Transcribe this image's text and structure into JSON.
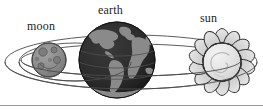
{
  "diagram": {
    "background_color": "#ffffff",
    "border_color": "#9a9a9a",
    "labels": {
      "moon": "moon",
      "earth": "earth",
      "sun": "sun"
    },
    "bodies": [
      {
        "name": "moon",
        "label": "moon",
        "cx": 49,
        "cy": 60,
        "r": 17,
        "fill_color": "#8e8e8e",
        "stroke_color": "#3c3c3c",
        "detail": "cratered gray disc"
      },
      {
        "name": "earth",
        "label": "earth",
        "cx": 117,
        "cy": 60,
        "r": 38,
        "fill_color": "#2b2b2b",
        "land_color": "#8a8a8a",
        "stroke_color": "#1a1a1a",
        "detail": "dark globe with gray continents"
      },
      {
        "name": "sun",
        "label": "sun",
        "cx": 222,
        "cy": 62,
        "r": 19,
        "ray_count": 14,
        "ray_outer_r": 34,
        "fill_color": "#e2e2e2",
        "ray_fill_color": "#d8d8d8",
        "stroke_color": "#2a2a2a",
        "detail": "flame-petal rays around light disc with spiral highlight"
      }
    ],
    "orbits": [
      {
        "name": "earth-orbit-outer",
        "cx": 131,
        "cy": 62,
        "rx": 126,
        "ry": 27,
        "stroke_color": "#4a4a4a"
      },
      {
        "name": "earth-orbit-inner",
        "cx": 131,
        "cy": 60,
        "rx": 110,
        "ry": 16,
        "stroke_color": "#4a4a4a"
      },
      {
        "name": "moon-orbit",
        "cx": 75,
        "cy": 62,
        "rx": 56,
        "ry": 19,
        "stroke_color": "#4a4a4a"
      }
    ]
  }
}
